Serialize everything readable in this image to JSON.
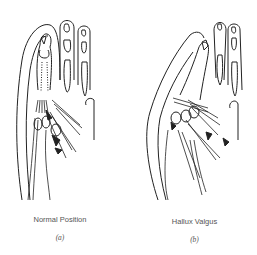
{
  "figure": {
    "panels": [
      {
        "id": "a",
        "caption": "Normal Position",
        "sublabel": "(a)"
      },
      {
        "id": "b",
        "caption": "Hallux Valgus",
        "sublabel": "(b)"
      }
    ]
  }
}
